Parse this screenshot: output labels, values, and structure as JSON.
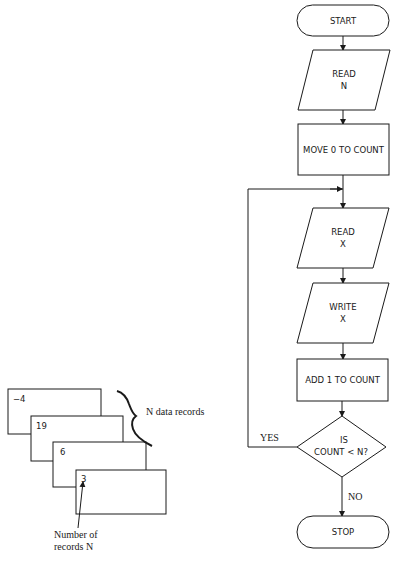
{
  "flowchart": {
    "start": "START",
    "read_n": [
      "READ",
      "N"
    ],
    "move": "MOVE 0 TO COUNT",
    "read_x": [
      "READ",
      "X"
    ],
    "write_x": [
      "WRITE",
      "X"
    ],
    "add": "ADD 1 TO COUNT",
    "decision": [
      "IS",
      "COUNT  <  N?"
    ],
    "yes_label": "YES",
    "no_label": "NO",
    "stop": "STOP"
  },
  "cards": {
    "values": [
      "−4",
      "19",
      "6",
      "3"
    ],
    "brace_label": "N data records",
    "pointer_label_line1": "Number of",
    "pointer_label_line2": "records N"
  },
  "colors": {
    "ink": "#1a1a1a",
    "background": "#ffffff"
  }
}
